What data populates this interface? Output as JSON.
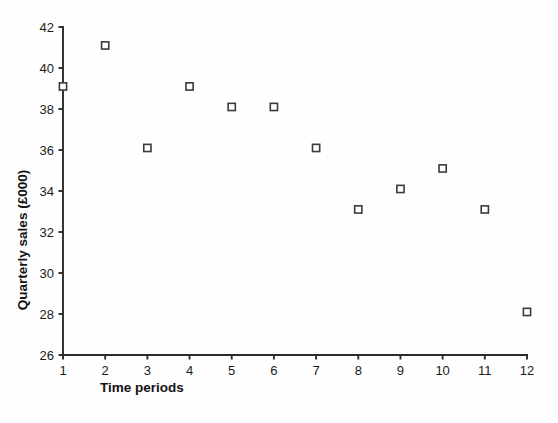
{
  "chart_data": {
    "type": "scatter",
    "title": "",
    "xlabel": "Time periods",
    "ylabel": "Quarterly sales (£000)",
    "x": [
      1,
      2,
      3,
      4,
      5,
      6,
      7,
      8,
      9,
      10,
      11,
      12
    ],
    "values": [
      39.1,
      41.1,
      36.1,
      39.1,
      38.1,
      38.1,
      36.1,
      33.1,
      34.1,
      35.1,
      33.1,
      28.1
    ],
    "xlim": [
      1,
      12
    ],
    "ylim": [
      26,
      42
    ],
    "xticks": [
      "1",
      "2",
      "3",
      "4",
      "5",
      "6",
      "7",
      "8",
      "9",
      "10",
      "11",
      "12"
    ],
    "yticks": [
      "26",
      "28",
      "30",
      "32",
      "34",
      "36",
      "38",
      "40",
      "42"
    ],
    "ytick_values": [
      26,
      28,
      30,
      32,
      34,
      36,
      38,
      40,
      42
    ],
    "grid": false,
    "legend": false,
    "marker": "open-square",
    "marker_color": "#3a3a3a",
    "marker_fill": "#ffffff",
    "axis_color": "#2b2b2b",
    "background": "#fefefe"
  }
}
